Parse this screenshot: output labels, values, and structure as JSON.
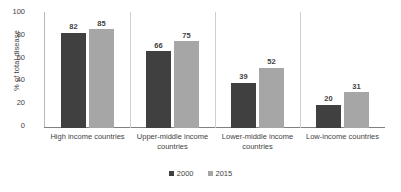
{
  "chart_data": {
    "type": "bar",
    "title": "",
    "subtitle": "",
    "xlabel": "",
    "ylabel": "% of total disease",
    "ylim": [
      0,
      100
    ],
    "yticks": [
      "0",
      "20",
      "40",
      "60",
      "80",
      "100"
    ],
    "grid": false,
    "legend_position": "bottom-center",
    "categories": [
      "High income countries",
      "Upper-middle income countries",
      "Lower-middle income countries",
      "Low-income countries"
    ],
    "series": [
      {
        "name": "2000",
        "color": "#404040",
        "values": [
          82,
          66,
          39,
          20
        ],
        "labels": [
          "82",
          "66",
          "39",
          "20"
        ]
      },
      {
        "name": "2015",
        "color": "#a6a6a6",
        "values": [
          85,
          75,
          52,
          31
        ],
        "labels": [
          "85",
          "75",
          "52",
          "31"
        ]
      }
    ]
  },
  "legend": {
    "items": [
      {
        "label": "2000",
        "color": "#404040"
      },
      {
        "label": "2015",
        "color": "#a6a6a6"
      }
    ]
  }
}
